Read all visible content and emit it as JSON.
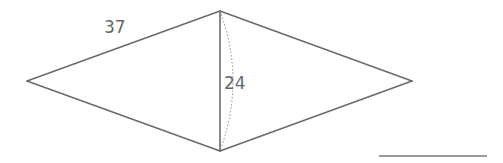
{
  "diagram": {
    "type": "rhombus (kite) with diagonal",
    "vertices": {
      "left": [
        27,
        81
      ],
      "top": [
        220,
        11
      ],
      "right": [
        412,
        81
      ],
      "bottom": [
        220,
        151
      ]
    },
    "labels": {
      "side_length": "37",
      "diagonal_length": "24"
    },
    "colors": {
      "edge": "#6a6a6a",
      "text": "#666666",
      "background": "#ffffff"
    }
  }
}
